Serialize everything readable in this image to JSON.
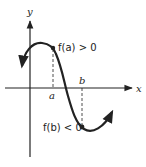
{
  "diagram": {
    "type": "function-graph",
    "axes": {
      "x_label": "x",
      "y_label": "y"
    },
    "points": {
      "a": {
        "label": "a",
        "annotation": "f(a) > 0"
      },
      "b": {
        "label": "b",
        "annotation": "f(b) < 0"
      }
    },
    "curve": {
      "description": "smooth continuous curve that is positive at a and negative at b (intermediate value theorem illustration)"
    },
    "colors": {
      "ink": "#222222",
      "background": "#ffffff"
    }
  }
}
